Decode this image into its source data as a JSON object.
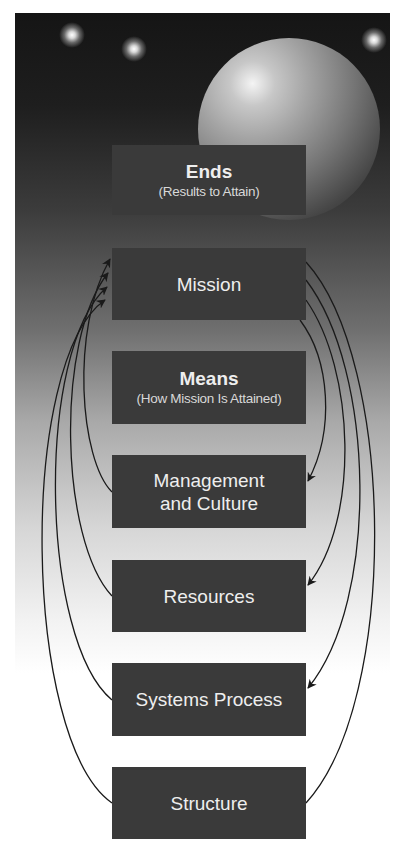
{
  "diagram": {
    "type": "hierarchy-with-feedback-loops",
    "colors": {
      "box_fill": "#3a3a3a",
      "box_text": "#eeeeee",
      "panel_top": "#151515",
      "panel_bottom": "#ffffff",
      "connector": "#1a1a1a"
    },
    "boxes": [
      {
        "id": "ends",
        "title": "Ends",
        "subtitle": "(Results to Attain)",
        "bold": true
      },
      {
        "id": "mission",
        "title": "Mission",
        "subtitle": ""
      },
      {
        "id": "means",
        "title": "Means",
        "subtitle": "(How Mission Is Attained)",
        "bold": true
      },
      {
        "id": "management",
        "title": "Management\nand Culture",
        "title_lines": [
          "Management",
          "and Culture"
        ],
        "subtitle": ""
      },
      {
        "id": "resources",
        "title": "Resources",
        "subtitle": ""
      },
      {
        "id": "systems",
        "title": "Systems Process",
        "subtitle": ""
      },
      {
        "id": "structure",
        "title": "Structure",
        "subtitle": ""
      }
    ],
    "connectors": [
      {
        "side": "left",
        "from": "management",
        "to": "mission",
        "arrowhead": "mission"
      },
      {
        "side": "left",
        "from": "resources",
        "to": "mission",
        "arrowhead": "mission"
      },
      {
        "side": "left",
        "from": "systems",
        "to": "mission",
        "arrowhead": "mission"
      },
      {
        "side": "left",
        "from": "structure",
        "to": "mission",
        "arrowhead": "mission"
      },
      {
        "side": "right",
        "from": "mission",
        "to": "management",
        "arrowhead": "management"
      },
      {
        "side": "right",
        "from": "mission",
        "to": "resources",
        "arrowhead": "resources"
      },
      {
        "side": "right",
        "from": "mission",
        "to": "systems",
        "arrowhead": "systems"
      },
      {
        "side": "right",
        "from": "mission",
        "to": "structure",
        "arrowhead": "none"
      }
    ]
  }
}
